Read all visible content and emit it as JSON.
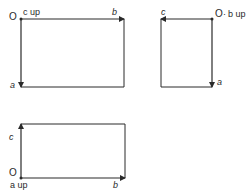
{
  "diagrams": [
    {
      "name": "c-up",
      "origin_label": "O",
      "up_label": "c up",
      "axis_h": "b",
      "axis_v": "a"
    },
    {
      "name": "b-up",
      "origin_label": "O",
      "up_label": "b up",
      "separator": "·",
      "axis_h": "c",
      "axis_v": "a"
    },
    {
      "name": "a-up",
      "origin_label": "O",
      "up_label": "a up",
      "axis_h": "b",
      "axis_v": "c"
    }
  ],
  "colors": {
    "line": "#2a2a2a"
  }
}
